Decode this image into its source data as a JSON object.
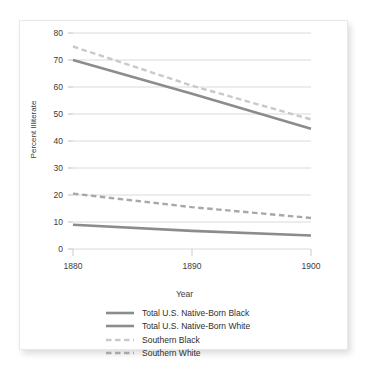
{
  "chart_data": {
    "type": "line",
    "title": "",
    "xlabel": "Year",
    "ylabel": "Percent Illiterate",
    "x": [
      1880,
      1890,
      1900
    ],
    "xlim": [
      1880,
      1900
    ],
    "ylim": [
      0,
      80
    ],
    "xticks": [
      "1880",
      "1890",
      "1900"
    ],
    "yticks": [
      "0",
      "10",
      "20",
      "30",
      "40",
      "50",
      "60",
      "70",
      "80"
    ],
    "grid": "horizontal",
    "legend_position": "bottom",
    "series": [
      {
        "name": "Total U.S. Native-Born Black",
        "values": [
          70.0,
          57.5,
          44.5
        ],
        "style": "solid",
        "color": "#8c8c8c",
        "width": 2.6
      },
      {
        "name": "Total U.S. Native-Born White",
        "values": [
          9.0,
          6.7,
          5.0
        ],
        "style": "solid",
        "color": "#8c8c8c",
        "width": 2.6
      },
      {
        "name": "Southern Black",
        "values": [
          75.0,
          60.5,
          48.0
        ],
        "style": "dashed",
        "color": "#c9c9c9",
        "width": 2.4
      },
      {
        "name": "Southern White",
        "values": [
          20.5,
          15.5,
          11.5
        ],
        "style": "dashed",
        "color": "#a8a8a8",
        "width": 2.4
      }
    ]
  },
  "legend": {
    "items": [
      {
        "label": "Total U.S. Native-Born Black"
      },
      {
        "label": "Total U.S. Native-Born White"
      },
      {
        "label": "Southern Black"
      },
      {
        "label": "Southern White"
      }
    ]
  }
}
